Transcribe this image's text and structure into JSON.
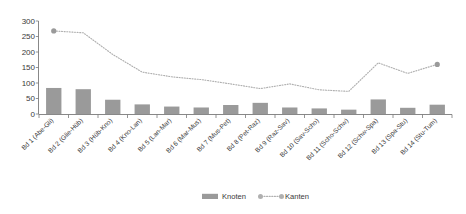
{
  "chart_data": {
    "type": "bar",
    "title": "",
    "xlabel": "",
    "ylabel": "",
    "ylim": [
      0,
      300
    ],
    "ytick_step": 50,
    "yticks": [
      "0",
      "50",
      "100",
      "150",
      "200",
      "250",
      "300"
    ],
    "grid": false,
    "legend_position": "bottom",
    "categories": [
      "Bd 1 (Abe-Gli)",
      "Bd 2 (Glie-Hüb)",
      "Bd 3 (Hüb-Kno)",
      "Bd 4 (Kno-Lan)",
      "Bd 5 (Lan-Mar)",
      "Bd 6 (Mar-Mus)",
      "Bd 7 (Mus-Pet)",
      "Bd 8 (Pet-Raz)",
      "Bd 9 (Raz-Sav)",
      "Bd 10 (Sav-Scho)",
      "Bd 11 (Scho-Schw)",
      "Bd 12 (Schw-Spa)",
      "Bd 13 (Spa-Stu)",
      "Bd 14 (Stu-Tum)"
    ],
    "series": [
      {
        "name": "Knoten",
        "kind": "bar",
        "color": "#9a9a9a",
        "values": [
          84,
          80,
          46,
          31,
          24,
          21,
          29,
          36,
          21,
          18,
          14,
          47,
          20,
          30
        ]
      },
      {
        "name": "Kanten",
        "kind": "line",
        "style": "dotted",
        "color": "#b0b0b0",
        "marker_color": "#9a9a9a",
        "values": [
          268,
          262,
          192,
          135,
          120,
          111,
          97,
          82,
          97,
          78,
          73,
          165,
          131,
          160
        ]
      }
    ]
  },
  "legend": {
    "items": [
      {
        "label": "Knoten",
        "marker": "bar-swatch",
        "color": "#9a9a9a"
      },
      {
        "label": "Kanten",
        "marker": "dotted-line-with-dot",
        "color": "#b0b0b0"
      }
    ]
  }
}
